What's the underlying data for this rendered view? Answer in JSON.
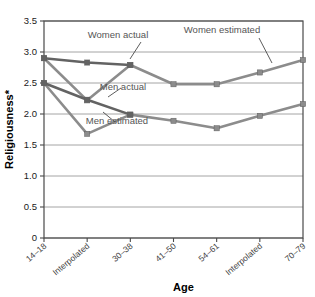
{
  "chart_data": {
    "type": "line",
    "title": "",
    "xlabel": "Age",
    "ylabel": "Religiousness*",
    "ylim": [
      0,
      3.5
    ],
    "ytick_labels": [
      "0",
      "0.5",
      "1.0",
      "1.5",
      "2.0",
      "2.5",
      "3.0",
      "3.5"
    ],
    "ytick_values": [
      0,
      0.5,
      1.0,
      1.5,
      2.0,
      2.5,
      3.0,
      3.5
    ],
    "grid": true,
    "legend_position": "inline-annotations",
    "categories": [
      "14–18",
      "Interpolated",
      "30–38",
      "41–50",
      "54–61",
      "Interpolated",
      "70–79"
    ],
    "series": [
      {
        "name": "Women estimated",
        "color": "#8c8c8c",
        "values": [
          2.9,
          2.22,
          2.79,
          2.48,
          2.48,
          2.67,
          2.87
        ]
      },
      {
        "name": "Women actual",
        "color": "#636363",
        "values": [
          2.9,
          null,
          2.79,
          null,
          null,
          null,
          null
        ],
        "note": "dark segment spans 14-18 through 30-38 via the 2.83 point at the Interpolated slot",
        "actual_points": [
          {
            "x": 0,
            "y": 2.9
          },
          {
            "x": 1,
            "y": 2.83
          },
          {
            "x": 2,
            "y": 2.79
          }
        ]
      },
      {
        "name": "Men estimated",
        "color": "#8c8c8c",
        "values": [
          2.5,
          1.68,
          1.99,
          1.89,
          1.77,
          1.97,
          2.16
        ]
      },
      {
        "name": "Men actual",
        "color": "#636363",
        "values": [
          2.5,
          null,
          1.99,
          null,
          null,
          null,
          null
        ],
        "actual_points": [
          {
            "x": 0,
            "y": 2.5
          },
          {
            "x": 1,
            "y": 2.23
          },
          {
            "x": 2,
            "y": 1.99
          }
        ]
      }
    ],
    "annotations": [
      {
        "label": "Women actual",
        "x": 118,
        "y": 38
      },
      {
        "label": "Women estimated",
        "x": 222,
        "y": 33
      },
      {
        "label": "Men actual",
        "x": 123,
        "y": 90
      },
      {
        "label": "Men estimated",
        "x": 117,
        "y": 124
      }
    ]
  },
  "axes": {
    "y_title": "Religiousness*",
    "x_title": "Age"
  }
}
